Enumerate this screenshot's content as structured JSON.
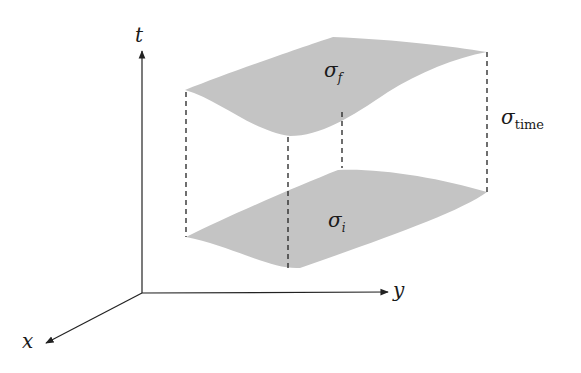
{
  "diagram": {
    "axes": {
      "t_label": "t",
      "y_label": "y",
      "x_label": "x"
    },
    "surfaces": {
      "final": {
        "symbol": "σ",
        "subscript": "f"
      },
      "initial": {
        "symbol": "σ",
        "subscript": "i"
      },
      "time": {
        "symbol": "σ",
        "subscript": "time"
      }
    },
    "colors": {
      "surface_fill": "#c4c4c4",
      "axis": "#222222",
      "dashed": "#222222"
    }
  }
}
